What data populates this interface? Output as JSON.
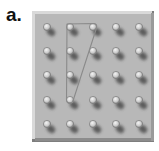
{
  "figure": {
    "label": "a.",
    "type": "geoboard",
    "grid": {
      "rows": 5,
      "cols": 5
    },
    "colors": {
      "board": "#b9b9b9",
      "board_highlight": "#dcdcdc",
      "board_shadow": "#7a7a7a",
      "peg": "#d8d8d8",
      "peg_shadow": "#3a3a3a",
      "band": "#8a8a8a"
    },
    "band": {
      "shape": "triangle",
      "vertices": [
        {
          "row": 0,
          "col": 1
        },
        {
          "row": 0,
          "col": 2
        },
        {
          "row": 3,
          "col": 1
        }
      ]
    }
  }
}
